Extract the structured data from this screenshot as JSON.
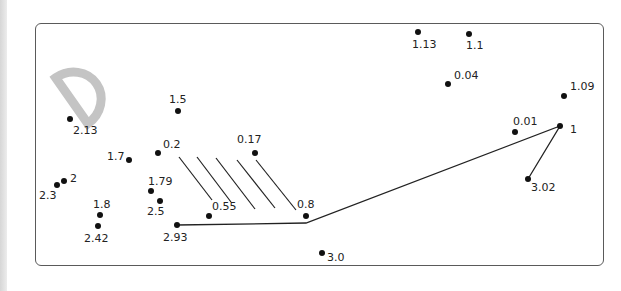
{
  "puzzle": {
    "type": "connect-the-dots",
    "frame_color": "#5a5a5a",
    "dot_color": "#111111",
    "line_color": "#222222",
    "decoration": {
      "letter": "D",
      "color": "#c4c4c4"
    },
    "points": [
      {
        "label": "1.13",
        "x": 418,
        "y": 32,
        "lx": 412,
        "ly": 39
      },
      {
        "label": "1.1",
        "x": 469,
        "y": 34,
        "lx": 466,
        "ly": 40
      },
      {
        "label": "0.04",
        "x": 448,
        "y": 84,
        "lx": 454,
        "ly": 70
      },
      {
        "label": "1.09",
        "x": 564,
        "y": 96,
        "lx": 570,
        "ly": 81
      },
      {
        "label": "0.01",
        "x": 515,
        "y": 132,
        "lx": 513,
        "ly": 116
      },
      {
        "label": "1",
        "x": 560,
        "y": 126,
        "lx": 570,
        "ly": 124
      },
      {
        "label": "3.02",
        "x": 528,
        "y": 179,
        "lx": 531,
        "ly": 182
      },
      {
        "label": "3.0",
        "x": 322,
        "y": 253,
        "lx": 327,
        "ly": 252
      },
      {
        "label": "0.8",
        "x": 306,
        "y": 216,
        "lx": 297,
        "ly": 199
      },
      {
        "label": "0.55",
        "x": 209,
        "y": 216,
        "lx": 212,
        "ly": 201
      },
      {
        "label": "2.93",
        "x": 177,
        "y": 225,
        "lx": 163,
        "ly": 232
      },
      {
        "label": "0.17",
        "x": 255,
        "y": 153,
        "lx": 237,
        "ly": 134
      },
      {
        "label": "0.2",
        "x": 158,
        "y": 153,
        "lx": 163,
        "ly": 139
      },
      {
        "label": "1.5",
        "x": 178,
        "y": 111,
        "lx": 169,
        "ly": 94
      },
      {
        "label": "2.13",
        "x": 70,
        "y": 119,
        "lx": 73,
        "ly": 125
      },
      {
        "label": "1.7",
        "x": 129,
        "y": 160,
        "lx": 107,
        "ly": 151
      },
      {
        "label": "2",
        "x": 64,
        "y": 181,
        "lx": 70,
        "ly": 173
      },
      {
        "label": "2.3",
        "x": 57,
        "y": 185,
        "lx": 39,
        "ly": 190
      },
      {
        "label": "1.79",
        "x": 151,
        "y": 191,
        "lx": 148,
        "ly": 176
      },
      {
        "label": "2.5",
        "x": 160,
        "y": 201,
        "lx": 147,
        "ly": 206
      },
      {
        "label": "1.8",
        "x": 100,
        "y": 215,
        "lx": 93,
        "ly": 199
      },
      {
        "label": "2.42",
        "x": 98,
        "y": 226,
        "lx": 84,
        "ly": 233
      }
    ],
    "polyline": [
      [
        177,
        225
      ],
      [
        306,
        223
      ],
      [
        560,
        126
      ],
      [
        528,
        179
      ]
    ],
    "hatch_lines": [
      [
        179,
        157,
        212,
        200
      ],
      [
        197,
        157,
        231,
        202
      ],
      [
        216,
        158,
        255,
        209
      ],
      [
        237,
        160,
        275,
        208
      ],
      [
        256,
        160,
        296,
        210
      ]
    ]
  }
}
